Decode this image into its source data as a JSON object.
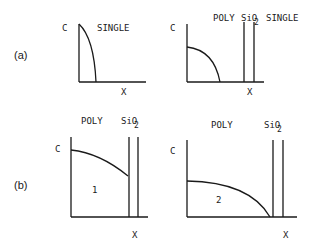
{
  "figure": {
    "panel_a": {
      "label": "(a)",
      "left": {
        "y_axis": "C",
        "x_axis": "X",
        "region_label": "SINGLE"
      },
      "right": {
        "y_axis": "C",
        "x_axis": "X",
        "region_labels": [
          "POLY",
          "SiO",
          "2",
          "SINGLE"
        ]
      }
    },
    "panel_b": {
      "label": "(b)",
      "left": {
        "y_axis": "C",
        "x_axis": "X",
        "region_labels": [
          "POLY",
          "SiO",
          "2"
        ],
        "curve_label": "1"
      },
      "right": {
        "y_axis": "C",
        "x_axis": "X",
        "region_labels": [
          "POLY",
          "SiO",
          "2"
        ],
        "curve_label": "2"
      }
    }
  }
}
